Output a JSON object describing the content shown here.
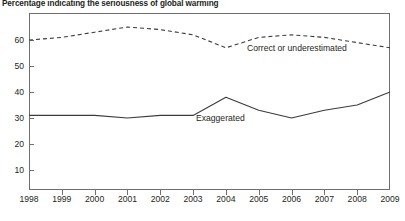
{
  "title": "Percentage indicating the seriousness of global warming",
  "axis": {
    "y_ticks": [
      10,
      20,
      30,
      40,
      50,
      60
    ],
    "x_ticks": [
      "1998",
      "1999",
      "2000",
      "2001",
      "2002",
      "2003",
      "2004",
      "2005",
      "2006",
      "2007",
      "2008",
      "2009"
    ]
  },
  "annotations": {
    "correct": "Correct or underestimated",
    "exaggerated": "Exaggerated"
  },
  "colors": {
    "line": "#3b3b3d",
    "frame": "#6f7072",
    "text": "#231f20",
    "background": "#ffffff"
  },
  "chart_data": {
    "type": "line",
    "title": "Percentage indicating the seriousness of global warming",
    "xlabel": "",
    "ylabel": "",
    "x": [
      1998,
      1999,
      2000,
      2001,
      2002,
      2003,
      2004,
      2005,
      2006,
      2007,
      2008,
      2009
    ],
    "ylim": [
      0,
      68
    ],
    "xlim": [
      1998,
      2009
    ],
    "grid": false,
    "legend": "inline-annotations",
    "series": [
      {
        "name": "Correct or underestimated",
        "style": "dashed",
        "values": [
          60,
          61,
          63,
          65,
          64,
          62,
          57,
          61,
          62,
          61,
          59,
          57
        ]
      },
      {
        "name": "Exaggerated",
        "style": "solid",
        "values": [
          31,
          31,
          31,
          30,
          31,
          31,
          38,
          33,
          30,
          33,
          35,
          40
        ]
      }
    ]
  }
}
